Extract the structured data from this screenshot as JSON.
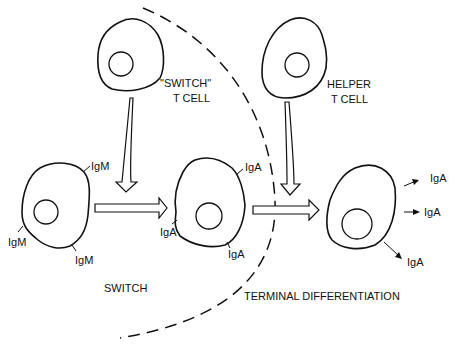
{
  "figure": {
    "regions": {
      "left": "SWITCH",
      "right": "TERMINAL DIFFERENTIATION"
    },
    "t_cells": [
      {
        "label_line1": "\"SWITCH\"",
        "label_line2": "T CELL"
      },
      {
        "label_line1": "HELPER",
        "label_line2": "T CELL"
      }
    ],
    "b_cells": [
      {
        "stage": "IgM B cell",
        "receptors": [
          "IgM",
          "IgM",
          "IgM"
        ]
      },
      {
        "stage": "IgA B cell",
        "receptors": [
          "IgA",
          "IgA",
          "IgA"
        ]
      },
      {
        "stage": "Plasma cell",
        "secreted": [
          "IgA",
          "IgA",
          "IgA"
        ]
      }
    ]
  }
}
